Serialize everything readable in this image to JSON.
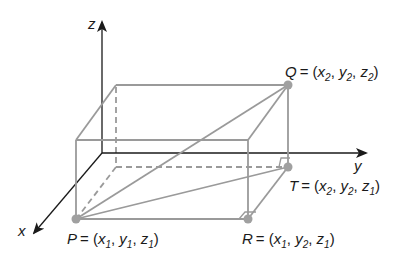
{
  "axes": {
    "x": "x",
    "y": "y",
    "z": "z"
  },
  "points": {
    "P": {
      "name": "P",
      "eq": "= (",
      "c1": "x",
      "s1": "1",
      "c2": "y",
      "s2": "1",
      "c3": "z",
      "s3": "1",
      "close": ")"
    },
    "Q": {
      "name": "Q",
      "eq": "= (",
      "c1": "x",
      "s1": "2",
      "c2": "y",
      "s2": "2",
      "c3": "z",
      "s3": "2",
      "close": ")"
    },
    "R": {
      "name": "R",
      "eq": "= (",
      "c1": "x",
      "s1": "1",
      "c2": "y",
      "s2": "2",
      "c3": "z",
      "s3": "1",
      "close": ")"
    },
    "T": {
      "name": "T",
      "eq": "= (",
      "c1": "x",
      "s1": "2",
      "c2": "y",
      "s2": "2",
      "c3": "z",
      "s3": "1",
      "close": ")"
    }
  },
  "colors": {
    "axis": "#1a1a1a",
    "box": "#9a9a9a",
    "point": "#a0a0a0"
  }
}
